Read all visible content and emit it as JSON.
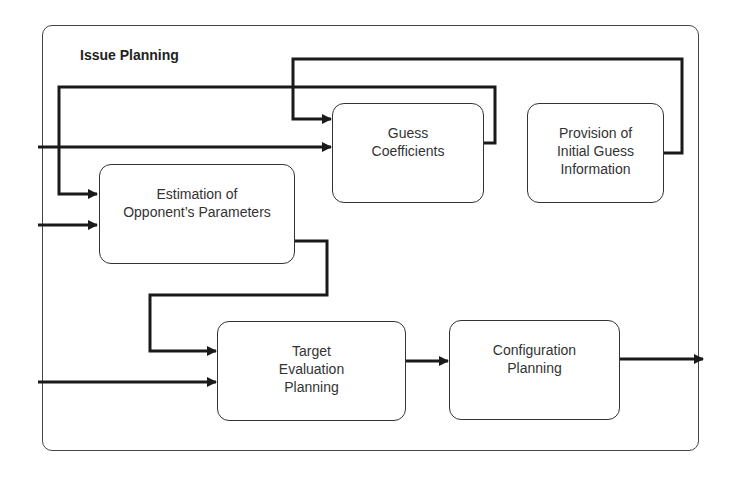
{
  "diagram": {
    "title": "Issue Planning",
    "nodes": [
      {
        "id": "guess_coefficients",
        "label": "Guess\nCoefficients"
      },
      {
        "id": "provision_initial_guess",
        "label": "Provision of\nInitial Guess\nInformation"
      },
      {
        "id": "estimation_opponent",
        "label": "Estimation of\nOpponent’s Parameters"
      },
      {
        "id": "target_evaluation",
        "label": "Target\nEvaluation\nPlanning"
      },
      {
        "id": "configuration_planning",
        "label": "Configuration\nPlanning"
      }
    ],
    "edges": [
      {
        "from": "external_input",
        "to": "guess_coefficients"
      },
      {
        "from": "provision_initial_guess",
        "to": "guess_coefficients"
      },
      {
        "from": "guess_coefficients",
        "to": "estimation_opponent"
      },
      {
        "from": "external_input",
        "to": "estimation_opponent"
      },
      {
        "from": "estimation_opponent",
        "to": "target_evaluation"
      },
      {
        "from": "external_input",
        "to": "target_evaluation"
      },
      {
        "from": "target_evaluation",
        "to": "configuration_planning"
      },
      {
        "from": "configuration_planning",
        "to": "external_output"
      }
    ],
    "colors": {
      "line": "#1a1a1a",
      "border": "#333333",
      "background": "#ffffff"
    }
  }
}
